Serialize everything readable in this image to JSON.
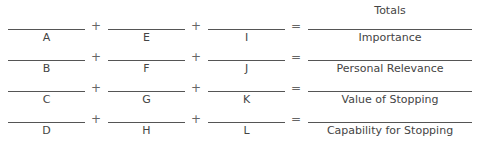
{
  "header": {
    "totals_label": "Totals"
  },
  "rows": [
    {
      "a": "A",
      "b": "E",
      "c": "I",
      "total": "Importance"
    },
    {
      "a": "B",
      "b": "F",
      "c": "J",
      "total": "Personal Relevance"
    },
    {
      "a": "C",
      "b": "G",
      "c": "K",
      "total": "Value of Stopping"
    },
    {
      "a": "D",
      "b": "H",
      "c": "L",
      "total": "Capability for Stopping"
    }
  ],
  "operators": {
    "plus": "+",
    "equals": "="
  }
}
